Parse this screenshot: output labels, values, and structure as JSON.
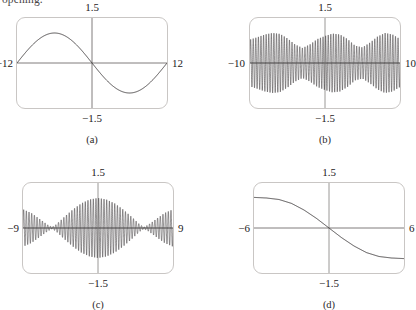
{
  "page": {
    "clipped_running_text": "opening."
  },
  "figure": {
    "panels": [
      {
        "caption": "(a)",
        "labels": {
          "top": "1.5",
          "bottom": "−1.5",
          "left": "−12",
          "right": "12"
        },
        "chart_data": {
          "type": "line",
          "title": "",
          "xlabel": "",
          "ylabel": "",
          "xlim": [
            -12,
            12
          ],
          "ylim": [
            -1.5,
            1.5
          ],
          "xticks": [
            -12,
            0,
            12
          ],
          "yticks": [
            -1.5,
            0,
            1.5
          ],
          "grid": false,
          "legend": "none",
          "description": "Single smooth sine-like wave completing one period across the window; rises from a trough near x=-6 through the origin to a crest near x=+6.",
          "series": [
            {
              "name": "curve-a",
              "kind": "sine",
              "amplitude": 1.0,
              "periods_in_window": 1,
              "x": [
                -12,
                -11,
                -10,
                -9,
                -8,
                -7,
                -6,
                -5,
                -4,
                -3,
                -2,
                -1,
                0,
                1,
                2,
                3,
                4,
                5,
                6,
                7,
                8,
                9,
                10,
                11,
                12
              ],
              "y": [
                0,
                -0.26,
                -0.5,
                -0.71,
                -0.87,
                -0.97,
                -1,
                -0.97,
                -0.87,
                -0.71,
                -0.5,
                -0.26,
                0,
                0.26,
                0.5,
                0.71,
                0.87,
                0.97,
                1,
                0.97,
                0.87,
                0.71,
                0.5,
                0.26,
                0
              ]
            }
          ]
        }
      },
      {
        "caption": "(b)",
        "labels": {
          "top": "1.5",
          "bottom": "−1.5",
          "left": "−10",
          "right": "10"
        },
        "chart_data": {
          "type": "line",
          "title": "",
          "xlabel": "",
          "ylabel": "",
          "xlim": [
            -10,
            10
          ],
          "ylim": [
            -1.5,
            1.5
          ],
          "xticks": [
            -10,
            0,
            10
          ],
          "yticks": [
            -1.5,
            0,
            1.5
          ],
          "grid": false,
          "legend": "none",
          "description": "Very high frequency oscillation that fills the window; the amplitude envelope is irregular, dipping to about half height near x=-3 and x=+4 and swelling near the edges and around x=-6 and x=+7.",
          "series": [
            {
              "name": "curve-b",
              "kind": "modulated-oscillation",
              "carrier_cycles_in_window": 58,
              "envelope_x": [
                -10,
                -9,
                -8,
                -7,
                -6,
                -5,
                -4,
                -3,
                -2,
                -1,
                0,
                1,
                2,
                3,
                4,
                5,
                6,
                7,
                8,
                9,
                10
              ],
              "envelope_y": [
                0.78,
                0.86,
                0.95,
                1.0,
                0.97,
                0.82,
                0.62,
                0.5,
                0.62,
                0.8,
                0.9,
                0.98,
                0.95,
                0.8,
                0.58,
                0.52,
                0.68,
                0.88,
                1.0,
                0.95,
                0.8
              ]
            }
          ]
        }
      },
      {
        "caption": "(c)",
        "labels": {
          "top": "1.5",
          "bottom": "−1.5",
          "left": "−9",
          "right": "9"
        },
        "chart_data": {
          "type": "line",
          "title": "",
          "xlabel": "",
          "ylabel": "",
          "xlim": [
            -9,
            9
          ],
          "ylim": [
            -1.5,
            1.5
          ],
          "xticks": [
            -9,
            0,
            9
          ],
          "yticks": [
            -1.5,
            0,
            1.5
          ],
          "grid": false,
          "legend": "none",
          "description": "Beat pattern: high frequency oscillation inside a slowly varying envelope with a tall central lobe peaking at x=0, nodes near x=-5.5 and x=+5.5, and smaller rising side lobes toward the left and right edges.",
          "series": [
            {
              "name": "curve-c",
              "kind": "beats",
              "carrier_cycles_in_window": 56,
              "envelope_x": [
                -9,
                -8,
                -7,
                -6,
                -5.5,
                -5,
                -4,
                -3,
                -2,
                -1,
                0,
                1,
                2,
                3,
                4,
                5,
                5.5,
                6,
                7,
                8,
                9
              ],
              "envelope_y": [
                0.62,
                0.5,
                0.3,
                0.1,
                0.03,
                0.12,
                0.38,
                0.62,
                0.82,
                0.95,
                1.0,
                0.95,
                0.82,
                0.62,
                0.38,
                0.12,
                0.03,
                0.1,
                0.3,
                0.5,
                0.62
              ]
            }
          ]
        }
      },
      {
        "caption": "(d)",
        "labels": {
          "top": "1.5",
          "bottom": "−1.5",
          "left": "−6",
          "right": "6"
        },
        "chart_data": {
          "type": "line",
          "title": "",
          "xlabel": "",
          "ylabel": "",
          "xlim": [
            -6,
            6
          ],
          "ylim": [
            -1.5,
            1.5
          ],
          "xticks": [
            -6,
            0,
            6
          ],
          "yticks": [
            -1.5,
            0,
            1.5
          ],
          "grid": false,
          "legend": "none",
          "description": "Smooth monotonically decreasing S-shaped curve passing through the origin, flattening toward a high plateau on the left and a low plateau on the right.",
          "series": [
            {
              "name": "curve-d",
              "kind": "decreasing-sigmoid",
              "x": [
                -6,
                -5,
                -4,
                -3,
                -2,
                -1,
                0,
                1,
                2,
                3,
                4,
                5,
                6
              ],
              "y": [
                1.02,
                1.0,
                0.95,
                0.82,
                0.6,
                0.32,
                0,
                -0.32,
                -0.6,
                -0.82,
                -0.95,
                -1.0,
                -1.02
              ]
            }
          ]
        }
      }
    ]
  }
}
